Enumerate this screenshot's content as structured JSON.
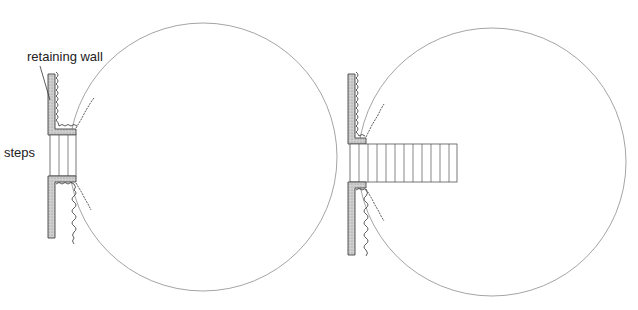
{
  "diagram": {
    "type": "plan-view comparison of steps through a retaining wall into a circular planting area",
    "labels": {
      "retaining_wall": "retaining wall",
      "steps": "steps"
    },
    "colors": {
      "line": "#555555",
      "circle": "#9a9a9a",
      "wall_fill": "#c8c8c8",
      "text": "#222222"
    },
    "panels": [
      {
        "id": "left",
        "description": "short steps set within the wall thickness",
        "circle": {
          "cx": 203,
          "cy": 157,
          "r": 134
        },
        "step_count": 4,
        "steps_box": {
          "x": 50,
          "y": 135,
          "w": 26,
          "h": 41
        }
      },
      {
        "id": "right",
        "description": "long flight of steps projecting into the circle",
        "circle": {
          "cx": 492,
          "cy": 162,
          "r": 134
        },
        "step_count": 11,
        "steps_box": {
          "x": 350,
          "y": 144,
          "w": 107,
          "h": 38
        }
      }
    ]
  }
}
